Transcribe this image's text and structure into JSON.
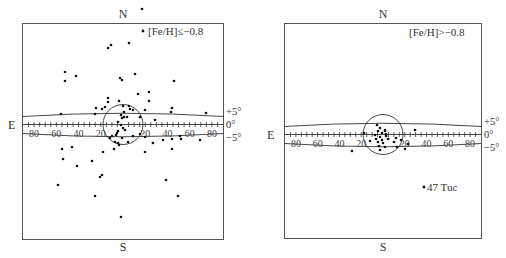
{
  "figure": {
    "panels": [
      {
        "id": "left",
        "label": "[Fe/H]≤−0.8",
        "north": "N",
        "south": "S",
        "east": "E",
        "lat_labels": [
          "+5°",
          "0°",
          "−5°"
        ],
        "lon_tick_labels": [
          "80",
          "60",
          "40",
          "20",
          "20",
          "40",
          "60",
          "80"
        ],
        "annotation": ""
      },
      {
        "id": "right",
        "label": "[Fe/H]>−0.8",
        "north": "N",
        "south": "S",
        "east": "E",
        "lat_labels": [
          "+5°",
          "0°",
          "−5°"
        ],
        "lon_tick_labels": [
          "80",
          "60",
          "40",
          "20",
          "20",
          "40",
          "60",
          "80"
        ],
        "annotation": "47 Tuc"
      }
    ]
  },
  "chart_data": [
    {
      "type": "scatter",
      "title": "[Fe/H]≤−0.8",
      "xlabel": "Galactic longitude (deg, centered on GC; E to left)",
      "ylabel": "Galactic latitude",
      "xlim": [
        -90,
        90
      ],
      "grid": false,
      "reference_lines_deg": [
        5,
        0,
        -5
      ],
      "circle_radius_deg": 20,
      "points_px": [
        [
          142,
          9
        ],
        [
          111,
          45
        ],
        [
          108,
          48
        ],
        [
          129,
          43
        ],
        [
          65,
          72
        ],
        [
          65,
          81
        ],
        [
          76,
          76
        ],
        [
          120,
          78
        ],
        [
          122,
          80
        ],
        [
          135,
          74
        ],
        [
          174,
          81
        ],
        [
          138,
          94
        ],
        [
          149,
          92
        ],
        [
          108,
          98
        ],
        [
          108,
          102
        ],
        [
          119,
          101
        ],
        [
          149,
          101
        ],
        [
          96,
          108
        ],
        [
          95,
          114
        ],
        [
          102,
          109
        ],
        [
          105,
          107
        ],
        [
          123,
          106
        ],
        [
          145,
          110
        ],
        [
          172,
          108
        ],
        [
          171,
          112
        ],
        [
          206,
          113
        ],
        [
          61,
          114
        ],
        [
          129,
          106
        ],
        [
          130,
          109
        ],
        [
          124,
          112
        ],
        [
          121,
          115
        ],
        [
          122,
          118
        ],
        [
          124,
          117
        ],
        [
          127,
          117
        ],
        [
          133,
          110
        ],
        [
          140,
          117
        ],
        [
          155,
          120
        ],
        [
          118,
          122
        ],
        [
          121,
          125
        ],
        [
          123,
          128
        ],
        [
          118,
          131
        ],
        [
          116,
          135
        ],
        [
          112,
          136
        ],
        [
          117,
          133
        ],
        [
          110,
          138
        ],
        [
          125,
          130
        ],
        [
          122,
          138
        ],
        [
          128,
          142
        ],
        [
          133,
          136
        ],
        [
          140,
          134
        ],
        [
          119,
          145
        ],
        [
          115,
          142
        ],
        [
          118,
          143
        ],
        [
          145,
          137
        ],
        [
          153,
          143
        ],
        [
          163,
          140
        ],
        [
          172,
          139
        ],
        [
          180,
          136
        ],
        [
          181,
          139
        ],
        [
          200,
          140
        ],
        [
          62,
          149
        ],
        [
          72,
          147
        ],
        [
          103,
          152
        ],
        [
          114,
          149
        ],
        [
          145,
          152
        ],
        [
          172,
          149
        ],
        [
          63,
          159
        ],
        [
          77,
          166
        ],
        [
          92,
          161
        ],
        [
          102,
          175
        ],
        [
          100,
          177
        ],
        [
          58,
          185
        ],
        [
          95,
          196
        ],
        [
          166,
          180
        ],
        [
          178,
          196
        ],
        [
          121,
          217
        ]
      ]
    },
    {
      "type": "scatter",
      "title": "[Fe/H]>−0.8",
      "xlabel": "Galactic longitude (deg, centered on GC; E to left)",
      "ylabel": "Galactic latitude",
      "xlim": [
        -90,
        90
      ],
      "grid": false,
      "reference_lines_deg": [
        5,
        0,
        -5
      ],
      "circle_radius_deg": 20,
      "points_px": [
        [
          377,
          125
        ],
        [
          380,
          128
        ],
        [
          364,
          133
        ],
        [
          375,
          135
        ],
        [
          378,
          131
        ],
        [
          382,
          133
        ],
        [
          385,
          130
        ],
        [
          386,
          134
        ],
        [
          380,
          137
        ],
        [
          382,
          140
        ],
        [
          383,
          143
        ],
        [
          378,
          142
        ],
        [
          376,
          139
        ],
        [
          379,
          146
        ],
        [
          385,
          147
        ],
        [
          388,
          139
        ],
        [
          394,
          142
        ],
        [
          397,
          147
        ],
        [
          385,
          131
        ],
        [
          386,
          136
        ],
        [
          401,
          140
        ],
        [
          396,
          138
        ],
        [
          415,
          130
        ],
        [
          352,
          151
        ],
        [
          370,
          141
        ],
        [
          380,
          150
        ],
        [
          408,
          144
        ],
        [
          405,
          149
        ]
      ],
      "annotated_points": [
        {
          "label": "47 Tuc",
          "px": [
            424,
            187
          ]
        }
      ]
    }
  ]
}
